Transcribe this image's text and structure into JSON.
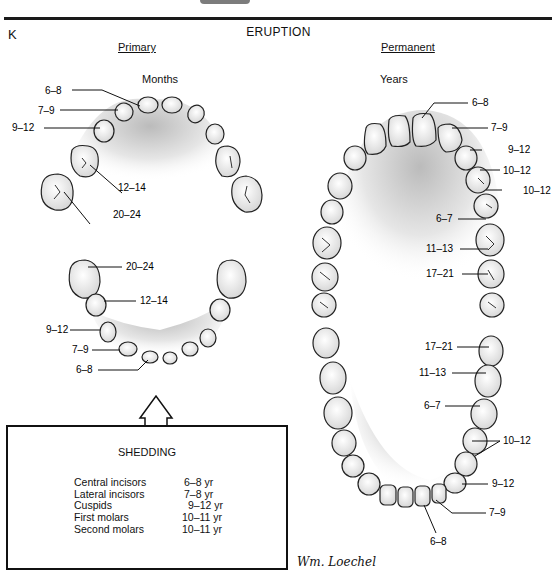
{
  "figure": {
    "panel_letter": "K",
    "title": "ERUPTION",
    "primary": {
      "heading": "Primary",
      "unit": "Months",
      "upper_labels": [
        "6–8",
        "7–9",
        "9–12",
        "12–14",
        "20–24"
      ],
      "lower_labels": [
        "20–24",
        "12–14",
        "9–12",
        "7–9",
        "6–8"
      ]
    },
    "permanent": {
      "heading": "Permanent",
      "unit": "Years",
      "upper_labels": [
        "6–8",
        "7–9",
        "9–12",
        "10–12",
        "10–12",
        "6–7",
        "11–13",
        "17–21"
      ],
      "lower_labels": [
        "17–21",
        "11–13",
        "6–7",
        "10–12",
        "9–12",
        "7–9",
        "6–8"
      ]
    },
    "shedding": {
      "title": "SHEDDING",
      "rows": [
        {
          "tooth": "Central incisors",
          "age": "6–8 yr"
        },
        {
          "tooth": "Lateral incisors",
          "age": "7–8 yr"
        },
        {
          "tooth": "Cuspids",
          "age": "9–12 yr"
        },
        {
          "tooth": "First molars",
          "age": "10–11 yr"
        },
        {
          "tooth": "Second molars",
          "age": "10–11 yr"
        }
      ]
    },
    "signature": "Wm. Loechel"
  }
}
